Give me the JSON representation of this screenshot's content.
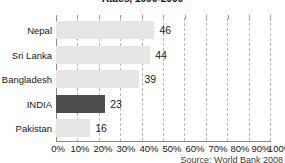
{
  "chart_data": {
    "type": "bar",
    "orientation": "horizontal",
    "title": "Rates, 1990-2000",
    "categories": [
      "Nepal",
      "Sri Lanka",
      "Bangladesh",
      "INDIA",
      "Pakistan"
    ],
    "values": [
      46,
      44,
      39,
      23,
      16
    ],
    "value_labels": [
      "46",
      "44",
      "39",
      "23",
      "16"
    ],
    "highlight_category": "INDIA",
    "xlabel": "",
    "ylabel": "",
    "xlim": [
      0,
      100
    ],
    "xticks": [
      0,
      10,
      20,
      30,
      40,
      50,
      60,
      70,
      80,
      90,
      100
    ],
    "xtick_labels": [
      "0%",
      "10%",
      "20%",
      "30%",
      "40%",
      "50%",
      "60%",
      "70%",
      "80%",
      "90%",
      "100%"
    ],
    "grid": true,
    "grid_axis": "x",
    "grid_style": "dashed",
    "legend": false,
    "source": "Source: World Bank 2008",
    "colors": {
      "bar": "#e6e6e6",
      "bar_highlight": "#4d4d4d",
      "gridline": "#b9b9b9",
      "axis": "#8a8a8a",
      "text": "#161616"
    }
  }
}
